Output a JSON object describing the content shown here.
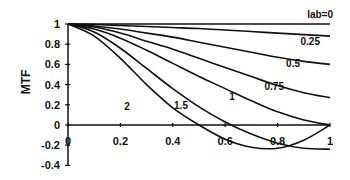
{
  "chart_data": {
    "type": "line",
    "title": "",
    "xlabel": "",
    "ylabel": "MTF",
    "xlim": [
      0,
      1
    ],
    "ylim": [
      -0.4,
      1
    ],
    "x_ticks": [
      "0",
      "0.2",
      "0.4",
      "0.6",
      "0.8",
      "1"
    ],
    "y_ticks": [
      "1",
      "0.8",
      "0.6",
      "0.4",
      "0.2",
      "0",
      "-0.2",
      "-0.4"
    ],
    "grid": false,
    "legend": "inline curve labels",
    "x": [
      0,
      0.1,
      0.2,
      0.3,
      0.4,
      0.5,
      0.6,
      0.7,
      0.8,
      0.9,
      1.0
    ],
    "series": [
      {
        "name": "lab=0",
        "values": [
          1,
          1,
          1,
          1,
          1,
          1,
          1,
          1,
          1,
          1,
          1
        ]
      },
      {
        "name": "0.25",
        "values": [
          1,
          0.995,
          0.985,
          0.975,
          0.965,
          0.955,
          0.94,
          0.925,
          0.91,
          0.895,
          0.88
        ]
      },
      {
        "name": "0.5",
        "values": [
          1,
          0.98,
          0.95,
          0.91,
          0.87,
          0.82,
          0.77,
          0.72,
          0.67,
          0.63,
          0.6
        ]
      },
      {
        "name": "0.75",
        "values": [
          1,
          0.97,
          0.91,
          0.83,
          0.75,
          0.66,
          0.57,
          0.48,
          0.39,
          0.32,
          0.27
        ]
      },
      {
        "name": "1",
        "values": [
          1,
          0.95,
          0.86,
          0.74,
          0.61,
          0.48,
          0.36,
          0.24,
          0.13,
          0.05,
          0
        ]
      },
      {
        "name": "1.5",
        "values": [
          1,
          0.92,
          0.76,
          0.56,
          0.36,
          0.18,
          0.03,
          -0.09,
          -0.18,
          -0.23,
          -0.24
        ]
      },
      {
        "name": "2",
        "values": [
          1,
          0.88,
          0.66,
          0.4,
          0.17,
          0.0,
          -0.14,
          -0.22,
          -0.23,
          -0.15,
          0
        ]
      }
    ],
    "annotations": [
      "lab=0",
      "0.25",
      "0.5",
      "0.75",
      "1",
      "1.5",
      "2"
    ]
  }
}
